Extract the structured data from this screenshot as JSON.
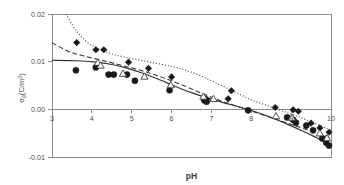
{
  "figure": {
    "xlabel": "pH",
    "ylabel_main": "σ",
    "ylabel_sub": "0",
    "ylabel_unit_open": "(C/m",
    "ylabel_unit_sup": "2",
    "ylabel_unit_close": ")",
    "background_color": "#ffffff",
    "axis_color": "#8c8c8c",
    "marker_color": "#1a1a1a",
    "open_marker_fill": "#fdfdfd"
  },
  "chart_data": {
    "type": "scatter",
    "title": "",
    "subtitle": "",
    "xlabel": "pH",
    "ylabel": "σ0(C/m2)",
    "xlim": [
      3,
      10
    ],
    "ylim": [
      -0.01,
      0.02
    ],
    "xticks": [
      3,
      4,
      5,
      6,
      7,
      8,
      9,
      10
    ],
    "xtick_labels": [
      "3",
      "4",
      "5",
      "6",
      "7",
      "8",
      "9",
      "10"
    ],
    "yticks": [
      -0.01,
      0.0,
      0.01,
      0.02
    ],
    "ytick_labels": [
      "-0.01",
      "0.00",
      "0.01",
      "0.02"
    ],
    "grid": false,
    "legend_position": "none",
    "zero_reference_line": 0.0,
    "series": [
      {
        "name": "series-diamond",
        "marker": "filled-diamond",
        "line_style": "dotted",
        "points": [
          {
            "x": 3.62,
            "y": 0.014
          },
          {
            "x": 4.1,
            "y": 0.0125
          },
          {
            "x": 4.3,
            "y": 0.0125
          },
          {
            "x": 4.92,
            "y": 0.0099
          },
          {
            "x": 5.42,
            "y": 0.0086
          },
          {
            "x": 6.0,
            "y": 0.0068
          },
          {
            "x": 6.82,
            "y": 0.0024
          },
          {
            "x": 6.88,
            "y": 0.0021
          },
          {
            "x": 7.42,
            "y": 0.0022
          },
          {
            "x": 7.5,
            "y": 0.0039
          },
          {
            "x": 8.6,
            "y": 0.0004
          },
          {
            "x": 9.05,
            "y": -0.0001
          },
          {
            "x": 9.18,
            "y": -0.0004
          },
          {
            "x": 9.5,
            "y": -0.0029
          },
          {
            "x": 9.72,
            "y": -0.0039
          },
          {
            "x": 9.95,
            "y": -0.0048
          }
        ]
      },
      {
        "name": "series-circle",
        "marker": "filled-circle",
        "line_style": "solid",
        "points": [
          {
            "x": 3.6,
            "y": 0.0082
          },
          {
            "x": 4.1,
            "y": 0.0088
          },
          {
            "x": 4.42,
            "y": 0.0073
          },
          {
            "x": 4.55,
            "y": 0.0073
          },
          {
            "x": 4.88,
            "y": 0.0073
          },
          {
            "x": 5.08,
            "y": 0.006
          },
          {
            "x": 5.95,
            "y": 0.004
          },
          {
            "x": 6.82,
            "y": 0.0019
          },
          {
            "x": 6.88,
            "y": 0.0016
          },
          {
            "x": 7.92,
            "y": -0.0002
          },
          {
            "x": 8.9,
            "y": -0.0017
          },
          {
            "x": 9.05,
            "y": -0.0022
          },
          {
            "x": 9.12,
            "y": -0.0028
          },
          {
            "x": 9.38,
            "y": -0.0034
          },
          {
            "x": 9.55,
            "y": -0.0044
          },
          {
            "x": 9.78,
            "y": -0.0061
          },
          {
            "x": 9.88,
            "y": -0.007
          },
          {
            "x": 9.95,
            "y": -0.0076
          }
        ]
      },
      {
        "name": "series-triangle",
        "marker": "open-triangle",
        "line_style": "dashed",
        "points": [
          {
            "x": 4.15,
            "y": 0.0098
          },
          {
            "x": 4.22,
            "y": 0.0092
          },
          {
            "x": 4.78,
            "y": 0.0075
          },
          {
            "x": 5.32,
            "y": 0.0069
          },
          {
            "x": 5.98,
            "y": 0.0051
          },
          {
            "x": 6.8,
            "y": 0.0027
          },
          {
            "x": 7.05,
            "y": 0.0022
          },
          {
            "x": 8.62,
            "y": -0.0014
          },
          {
            "x": 9.02,
            "y": -0.0017
          },
          {
            "x": 9.72,
            "y": -0.005
          },
          {
            "x": 9.9,
            "y": -0.006
          }
        ]
      }
    ],
    "fit_curves": [
      {
        "name": "fit-dotted",
        "style": "dotted",
        "points": [
          {
            "x": 3.35,
            "y": 0.02
          },
          {
            "x": 3.6,
            "y": 0.0166
          },
          {
            "x": 3.9,
            "y": 0.014
          },
          {
            "x": 4.3,
            "y": 0.0122
          },
          {
            "x": 4.8,
            "y": 0.011
          },
          {
            "x": 5.4,
            "y": 0.01
          },
          {
            "x": 6.0,
            "y": 0.009
          },
          {
            "x": 6.5,
            "y": 0.0078
          },
          {
            "x": 7.0,
            "y": 0.006
          },
          {
            "x": 7.5,
            "y": 0.004
          },
          {
            "x": 8.0,
            "y": 0.002
          },
          {
            "x": 8.5,
            "y": 0.0005
          },
          {
            "x": 9.0,
            "y": -0.001
          },
          {
            "x": 9.5,
            "y": -0.0026
          },
          {
            "x": 10.0,
            "y": -0.0044
          }
        ]
      },
      {
        "name": "fit-dashed",
        "style": "dashed",
        "points": [
          {
            "x": 3.0,
            "y": 0.014
          },
          {
            "x": 3.4,
            "y": 0.0122
          },
          {
            "x": 3.8,
            "y": 0.0112
          },
          {
            "x": 4.3,
            "y": 0.0102
          },
          {
            "x": 4.8,
            "y": 0.0091
          },
          {
            "x": 5.3,
            "y": 0.008
          },
          {
            "x": 5.8,
            "y": 0.0066
          },
          {
            "x": 6.3,
            "y": 0.005
          },
          {
            "x": 6.8,
            "y": 0.0032
          },
          {
            "x": 7.3,
            "y": 0.0016
          },
          {
            "x": 7.8,
            "y": 0.0002
          },
          {
            "x": 8.3,
            "y": -0.0012
          },
          {
            "x": 8.8,
            "y": -0.0026
          },
          {
            "x": 9.3,
            "y": -0.004
          },
          {
            "x": 10.0,
            "y": -0.006
          }
        ]
      },
      {
        "name": "fit-solid",
        "style": "solid",
        "points": [
          {
            "x": 3.0,
            "y": 0.0103
          },
          {
            "x": 3.6,
            "y": 0.0102
          },
          {
            "x": 4.1,
            "y": 0.0099
          },
          {
            "x": 4.5,
            "y": 0.0094
          },
          {
            "x": 4.9,
            "y": 0.0086
          },
          {
            "x": 5.3,
            "y": 0.0075
          },
          {
            "x": 5.7,
            "y": 0.0062
          },
          {
            "x": 6.1,
            "y": 0.0048
          },
          {
            "x": 6.5,
            "y": 0.0035
          },
          {
            "x": 6.9,
            "y": 0.0024
          },
          {
            "x": 7.3,
            "y": 0.0014
          },
          {
            "x": 7.7,
            "y": 0.0005
          },
          {
            "x": 8.1,
            "y": -0.0005
          },
          {
            "x": 8.5,
            "y": -0.0017
          },
          {
            "x": 8.9,
            "y": -0.0031
          },
          {
            "x": 9.3,
            "y": -0.0046
          },
          {
            "x": 9.65,
            "y": -0.006
          },
          {
            "x": 10.0,
            "y": -0.0074
          }
        ]
      }
    ]
  }
}
